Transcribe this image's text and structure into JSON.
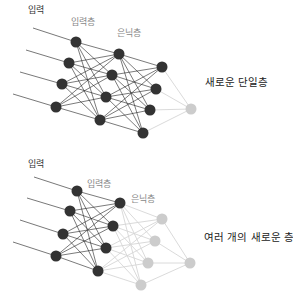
{
  "top_network": {
    "labels": {
      "input": "입력",
      "input_layer": "입력층",
      "hidden_layer": "은닉층",
      "caption": "새로운 단일층"
    },
    "input_lines": [
      [
        33,
        28,
        76,
        42
      ],
      [
        26,
        50,
        69,
        63
      ],
      [
        20,
        72,
        62,
        84
      ],
      [
        13,
        94,
        56,
        107
      ]
    ],
    "layers": [
      {
        "name": "input-layer",
        "color": "#333333",
        "nodes": [
          [
            76,
            42
          ],
          [
            69,
            63
          ],
          [
            62,
            84
          ],
          [
            56,
            107
          ]
        ]
      },
      {
        "name": "hidden-layer-1",
        "color": "#333333",
        "nodes": [
          [
            119,
            54
          ],
          [
            112,
            75
          ],
          [
            106,
            97
          ],
          [
            100,
            120
          ]
        ]
      },
      {
        "name": "hidden-layer-2",
        "color": "#333333",
        "nodes": [
          [
            162,
            67
          ],
          [
            156,
            89
          ],
          [
            150,
            110
          ],
          [
            143,
            133
          ]
        ]
      },
      {
        "name": "new-output-layer",
        "color": "#cccccc",
        "nodes": [
          [
            191,
            109
          ]
        ]
      }
    ]
  },
  "bottom_network": {
    "labels": {
      "input": "입력",
      "input_layer": "입력층",
      "hidden_layer": "은닉층",
      "caption": "여러 개의 새로운 층"
    },
    "input_lines": [
      [
        34,
        177,
        77,
        191
      ],
      [
        27,
        198,
        70,
        211
      ],
      [
        20,
        220,
        63,
        234
      ],
      [
        13,
        242,
        56,
        256
      ]
    ],
    "layers": [
      {
        "name": "input-layer",
        "color": "#333333",
        "nodes": [
          [
            77,
            191
          ],
          [
            70,
            211
          ],
          [
            63,
            234
          ],
          [
            56,
            256
          ]
        ]
      },
      {
        "name": "hidden-layer-1",
        "color": "#333333",
        "nodes": [
          [
            120,
            203
          ],
          [
            113,
            226
          ],
          [
            106,
            248
          ],
          [
            98,
            271
          ]
        ]
      },
      {
        "name": "new-hidden-layer",
        "color": "#cccccc",
        "nodes": [
          [
            162,
            219
          ],
          [
            155,
            241
          ],
          [
            148,
            263
          ],
          [
            141,
            285
          ]
        ]
      },
      {
        "name": "new-output-layer",
        "color": "#cccccc",
        "nodes": [
          [
            190,
            263
          ]
        ]
      }
    ]
  },
  "colors": {
    "dark_node": "#333333",
    "new_node": "#cccccc",
    "dark_edge": "#222222",
    "new_edge": "#d6d6d6"
  }
}
